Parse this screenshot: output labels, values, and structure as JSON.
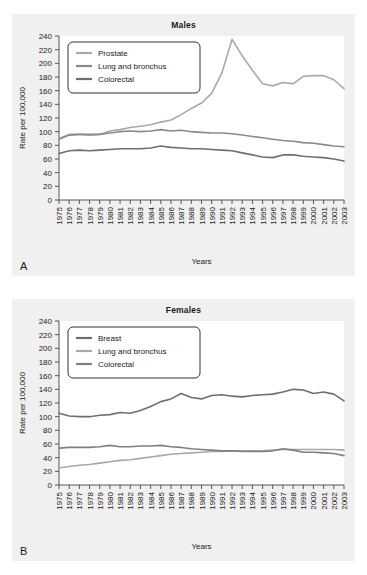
{
  "page": {
    "background_color": "#ffffff",
    "panel_background_color": "#f0f0f0",
    "plot_background_color": "#ffffff",
    "axis_color": "#555555"
  },
  "panels": [
    {
      "letter": "A",
      "title": "Males",
      "xlabel": "Years",
      "ylabel": "Rate per 100,000"
    },
    {
      "letter": "B",
      "title": "Females",
      "xlabel": "Years",
      "ylabel": "Rate per 100,000"
    }
  ],
  "chart_data": [
    {
      "type": "line",
      "title": "Males",
      "panel_letter": "A",
      "xlabel": "Years",
      "ylabel": "Rate per 100,000",
      "grid": false,
      "legend_position": "top-left",
      "xlim": [
        1975,
        2003
      ],
      "ylim": [
        0,
        240
      ],
      "ytick_step": 20,
      "yticks": [
        0,
        20,
        40,
        60,
        80,
        100,
        120,
        140,
        160,
        180,
        200,
        220,
        240
      ],
      "x": [
        1975,
        1976,
        1977,
        1978,
        1979,
        1980,
        1981,
        1982,
        1983,
        1984,
        1985,
        1986,
        1987,
        1988,
        1989,
        1990,
        1991,
        1992,
        1993,
        1994,
        1995,
        1996,
        1997,
        1998,
        1999,
        2000,
        2001,
        2002,
        2003
      ],
      "categories": [
        "1975",
        "1976",
        "1977",
        "1978",
        "1979",
        "1980",
        "1981",
        "1982",
        "1983",
        "1984",
        "1985",
        "1986",
        "1987",
        "1988",
        "1989",
        "1990",
        "1991",
        "1992",
        "1993",
        "1994",
        "1995",
        "1996",
        "1997",
        "1998",
        "1999",
        "2000",
        "2001",
        "2002",
        "2003"
      ],
      "series": [
        {
          "name": "Prostate",
          "color": "#a8a8a8",
          "values": [
            90,
            96,
            96,
            95,
            96,
            101,
            103,
            106,
            108,
            110,
            114,
            117,
            125,
            134,
            142,
            156,
            186,
            235,
            211,
            190,
            170,
            167,
            172,
            170,
            181,
            182,
            182,
            176,
            163
          ]
        },
        {
          "name": "Lung and bronchus",
          "color": "#8a8a8a",
          "values": [
            89,
            95,
            96,
            96,
            96,
            98,
            100,
            101,
            100,
            101,
            103,
            101,
            102,
            100,
            99,
            98,
            98,
            97,
            95,
            93,
            91,
            89,
            87,
            86,
            84,
            83,
            81,
            79,
            78
          ]
        },
        {
          "name": "Colorectal",
          "color": "#6e6e6e",
          "values": [
            68,
            72,
            73,
            72,
            73,
            74,
            75,
            75,
            75,
            76,
            79,
            77,
            76,
            75,
            75,
            74,
            73,
            72,
            69,
            66,
            63,
            62,
            66,
            66,
            64,
            63,
            62,
            60,
            57
          ]
        }
      ]
    },
    {
      "type": "line",
      "title": "Females",
      "panel_letter": "B",
      "xlabel": "Years",
      "ylabel": "Rate per 100,000",
      "grid": false,
      "legend_position": "top-left",
      "xlim": [
        1975,
        2003
      ],
      "ylim": [
        0,
        240
      ],
      "ytick_step": 20,
      "yticks": [
        0,
        20,
        40,
        60,
        80,
        100,
        120,
        140,
        160,
        180,
        200,
        220,
        240
      ],
      "x": [
        1975,
        1976,
        1977,
        1978,
        1979,
        1980,
        1981,
        1982,
        1983,
        1984,
        1985,
        1986,
        1987,
        1988,
        1989,
        1990,
        1991,
        1992,
        1993,
        1994,
        1995,
        1996,
        1997,
        1998,
        1999,
        2000,
        2001,
        2002,
        2003
      ],
      "categories": [
        "1975",
        "1976",
        "1977",
        "1978",
        "1979",
        "1980",
        "1981",
        "1982",
        "1983",
        "1984",
        "1985",
        "1986",
        "1987",
        "1988",
        "1989",
        "1990",
        "1991",
        "1992",
        "1993",
        "1994",
        "1995",
        "1996",
        "1997",
        "1998",
        "1999",
        "2000",
        "2001",
        "2002",
        "2003"
      ],
      "series": [
        {
          "name": "Breast",
          "color": "#6e6e6e",
          "values": [
            105,
            101,
            100,
            100,
            102,
            103,
            106,
            105,
            109,
            115,
            122,
            126,
            134,
            128,
            126,
            131,
            132,
            130,
            129,
            131,
            132,
            133,
            136,
            140,
            139,
            134,
            136,
            133,
            123
          ]
        },
        {
          "name": "Lung and bronchus",
          "color": "#a8a8a8",
          "values": [
            25,
            27,
            29,
            30,
            32,
            34,
            36,
            37,
            39,
            41,
            43,
            45,
            46,
            47,
            48,
            49,
            49,
            50,
            50,
            50,
            50,
            51,
            52,
            52,
            52,
            52,
            52,
            52,
            51
          ]
        },
        {
          "name": "Colorectal",
          "color": "#808080",
          "values": [
            54,
            55,
            55,
            55,
            56,
            58,
            56,
            56,
            57,
            57,
            58,
            56,
            55,
            53,
            52,
            51,
            50,
            50,
            49,
            49,
            49,
            50,
            53,
            51,
            48,
            48,
            47,
            46,
            43
          ]
        }
      ]
    }
  ]
}
